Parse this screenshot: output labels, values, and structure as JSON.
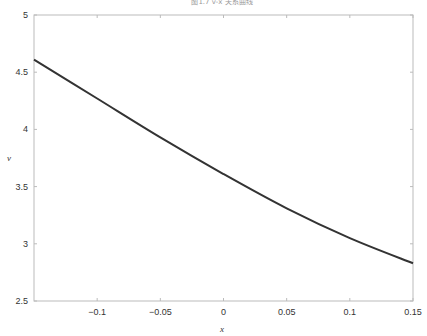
{
  "chart_data": {
    "type": "line",
    "title": "图1.7 v-x 关系曲线",
    "xlabel": "x",
    "ylabel": "v",
    "xlim": [
      -0.15,
      0.15
    ],
    "ylim": [
      2.5,
      5
    ],
    "xticks": [
      -0.1,
      -0.05,
      0,
      0.05,
      0.1,
      0.15
    ],
    "xtick_labels": [
      "−0.1",
      "−0.05",
      "0",
      "0.05",
      "0.1",
      "0.15"
    ],
    "yticks": [
      2.5,
      3,
      3.5,
      4,
      4.5,
      5
    ],
    "ytick_labels": [
      "2.5",
      "3",
      "3.5",
      "4",
      "4.5",
      "5"
    ],
    "grid": false,
    "legend": null,
    "series": [
      {
        "name": "v",
        "color": "#333333",
        "x": [
          -0.15,
          -0.1,
          -0.05,
          0,
          0.05,
          0.1,
          0.15
        ],
        "y": [
          4.61,
          4.27,
          3.93,
          3.61,
          3.31,
          3.05,
          2.83
        ]
      }
    ]
  },
  "colors": {
    "axis": "#bbbbbb",
    "line": "#333333",
    "text": "#333333"
  }
}
